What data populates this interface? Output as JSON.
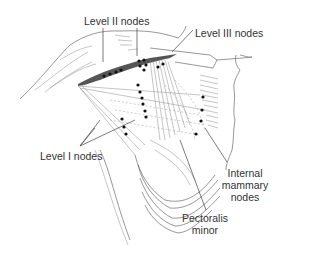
{
  "diagram": {
    "labels": {
      "level2": "Level II nodes",
      "level3": "Level III nodes",
      "level1": "Level I nodes",
      "internal_mammary_line1": "Internal",
      "internal_mammary_line2": "mammary",
      "internal_mammary_line3": "nodes",
      "pectoralis_line1": "Pectoralis",
      "pectoralis_line2": "minor"
    },
    "colors": {
      "ink": "#333333",
      "node": "#111111",
      "muscle_band": "#555555",
      "background": "#ffffff"
    }
  }
}
